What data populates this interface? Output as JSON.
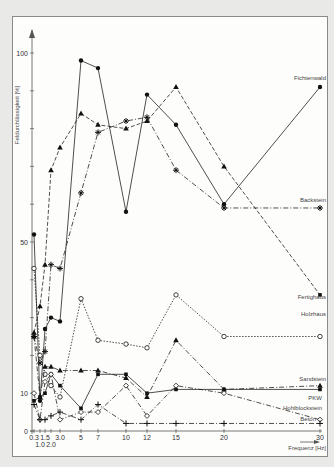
{
  "chart_data": {
    "type": "line",
    "title": "",
    "xlabel": "Frequenz [Hz]",
    "ylabel": "Feldurchlässigkeit [%]",
    "ylim": [
      0,
      100
    ],
    "xlim": [
      0,
      30
    ],
    "grid": false,
    "x_tick_labels": [
      "0.3",
      "1.0",
      "1.5",
      "2.0",
      "3.0",
      "5",
      "7",
      "10",
      "12",
      "15",
      "20",
      "30"
    ],
    "y_tick_labels": [
      "0",
      "10",
      "50",
      "100"
    ],
    "x": [
      0.3,
      1.0,
      1.5,
      2.0,
      3.0,
      5,
      7,
      10,
      12,
      15,
      20,
      30
    ],
    "series": [
      {
        "name": "Fichtenwald",
        "marker": "filled-circle",
        "line": "solid",
        "values": [
          52,
          8,
          27,
          30,
          29,
          98,
          96,
          58,
          89,
          81,
          60,
          91
        ]
      },
      {
        "name": "Backstein",
        "marker": "star",
        "line": "dash-dot",
        "values": [
          25,
          18,
          21,
          44,
          43,
          63,
          79,
          82,
          83,
          69,
          59,
          59
        ]
      },
      {
        "name": "Fertighaus",
        "marker": "filled-triangle",
        "line": "dashed",
        "values": [
          26,
          33,
          44,
          69,
          75,
          84,
          81,
          80,
          82,
          91,
          70,
          36
        ]
      },
      {
        "name": "Holzhaus",
        "marker": "open-circle",
        "line": "dotted",
        "values": [
          43,
          20,
          15,
          12,
          9,
          35,
          24,
          23,
          22,
          36,
          25,
          25
        ]
      },
      {
        "name": "Sandstein",
        "marker": "filled-triangle",
        "line": "dash-dot",
        "values": [
          25,
          9,
          17,
          17,
          16,
          16,
          16,
          14,
          9,
          24,
          11,
          12
        ]
      },
      {
        "name": "PKW",
        "marker": "filled-square",
        "line": "solid",
        "values": [
          8,
          9,
          10,
          15,
          12,
          6,
          15,
          15,
          10,
          11,
          11,
          11
        ]
      },
      {
        "name": "Hohlblockstein",
        "marker": "open-diamond",
        "line": "dash-dot",
        "values": [
          10,
          3,
          13,
          15,
          3,
          5,
          5,
          12,
          4,
          12,
          10,
          3
        ]
      },
      {
        "name": "Beton",
        "marker": "plus",
        "line": "dash-dot",
        "values": [
          7,
          3,
          3,
          4,
          5,
          3,
          7,
          2,
          2,
          2,
          2,
          2
        ]
      }
    ]
  },
  "labels": {
    "fichtenwald": "Fichtenwald",
    "backstein": "Backstein",
    "fertighaus": "Fertighaus",
    "holzhaus": "Holzhaus",
    "sandstein": "Sandstein",
    "pkw": "PKW",
    "hohlblockstein": "Hohlblockstein",
    "beton": "Beton",
    "xlabel": "Frequenz [Hz]",
    "ylabel": "Feldurchlässigkeit [%]"
  }
}
